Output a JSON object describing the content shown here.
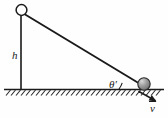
{
  "figure": {
    "background_color": "#fefefe",
    "stroke_color": "#1a1a1a",
    "labels": {
      "height": "h",
      "angle": "θ",
      "angle_prime": "′",
      "velocity": "v"
    },
    "elements": {
      "pivot_circle": "open-circle",
      "ball": "filled-gray-sphere",
      "ground": "hatched-ground-line",
      "incline": "incline-line",
      "height_line": "vertical-height-line",
      "angle_arc": "angle-arc",
      "velocity_arrow": "velocity-arrow"
    },
    "colors": {
      "ball_fill": "#8c8c8c",
      "ball_highlight": "#d0d0d0",
      "ball_stroke": "#2a2a2a",
      "line": "#1a1a1a",
      "hatch": "#2a2a2a"
    },
    "geometry": {
      "apex": [
        21,
        16
      ],
      "foot": [
        21,
        89
      ],
      "ball_center": [
        144,
        84
      ],
      "ball_radius": 6,
      "ground_y": 89,
      "ground_x_start": 4,
      "ground_x_end": 164,
      "pivot_circle_center": [
        21,
        10
      ],
      "pivot_circle_radius": 5.5,
      "velocity_arrow_from": [
        140,
        92
      ],
      "velocity_arrow_to": [
        156,
        101
      ]
    }
  }
}
